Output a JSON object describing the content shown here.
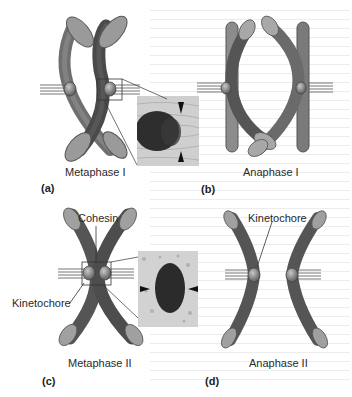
{
  "figure": {
    "panels": [
      {
        "letter": "(a)",
        "stage": "Metaphase I"
      },
      {
        "letter": "(b)",
        "stage": "Anaphase I"
      },
      {
        "letter": "(c)",
        "stage": "Metaphase II"
      },
      {
        "letter": "(d)",
        "stage": "Anaphase II"
      }
    ],
    "annotations": {
      "cohesin": "Cohesin",
      "kinetochore_c": "Kinetochore",
      "kinetochore_d": "Kinetochore"
    },
    "colors": {
      "chromosome_dark": "#5a5a5a",
      "chromosome_mid": "#7d7d7d",
      "chromosome_light": "#a8a8a8",
      "spindle": "#8a8a8a",
      "micrograph_bg": "#d4d4d4",
      "micrograph_blob": "#2e2e2e"
    }
  }
}
